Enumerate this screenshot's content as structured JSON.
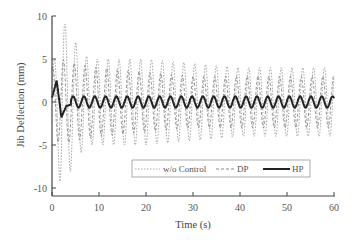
{
  "chart_data": {
    "type": "line",
    "title": "",
    "xlabel": "Time (s)",
    "ylabel": "Jib Deflection (mm)",
    "xlim": [
      0,
      60
    ],
    "ylim": [
      -12,
      10
    ],
    "xticks": [
      0,
      10,
      20,
      30,
      40,
      50,
      60
    ],
    "yticks": [
      10,
      5,
      0,
      -5,
      -10
    ],
    "grid": false,
    "legend_position": "lower center, inside",
    "series": [
      {
        "name": "w/o Control",
        "style": "dotted",
        "color": "#9a9a9a",
        "description": "Large initial swing decaying to ~±4 mm oscillation",
        "x": [
          0,
          1,
          2,
          3,
          4,
          5,
          6,
          8,
          10,
          20,
          30,
          40,
          50,
          60
        ],
        "amplitude": [
          4,
          6,
          11,
          9,
          8,
          7,
          6,
          5,
          5,
          5,
          4.5,
          4,
          4,
          4
        ]
      },
      {
        "name": "DP",
        "style": "dashed",
        "color": "#888888",
        "description": "Oscillation ~±4 mm, period ~2.3 s",
        "x": [
          0,
          2,
          5,
          10,
          20,
          30,
          40,
          50,
          60
        ],
        "amplitude": [
          4,
          5,
          4.5,
          4,
          3.5,
          3,
          3,
          3,
          3
        ]
      },
      {
        "name": "HP",
        "style": "solid",
        "color": "#222222",
        "description": "Initial peak ~2.5 mm at 1 s, dip to ~-1.8 mm at 2 s, then steady oscillation ~±0.7 mm",
        "x": [
          0,
          1,
          2,
          3,
          4,
          6,
          10,
          20,
          30,
          40,
          50,
          60
        ],
        "values": [
          0.5,
          2.5,
          -1.8,
          -0.5,
          -0.3,
          0.7,
          0.6,
          0.6,
          0.6,
          0.6,
          0.6,
          -0.5
        ]
      }
    ]
  },
  "legend": {
    "items": [
      {
        "label": "w/o Control"
      },
      {
        "label": "DP"
      },
      {
        "label": "HP"
      }
    ]
  },
  "axes": {
    "x_ticks": [
      "0",
      "10",
      "20",
      "30",
      "40",
      "50",
      "60"
    ],
    "y_ticks": [
      "10",
      "5",
      "0",
      "-5",
      "-10"
    ],
    "xlabel": "Time (s)",
    "ylabel": "Jib Deflection (mm)"
  }
}
